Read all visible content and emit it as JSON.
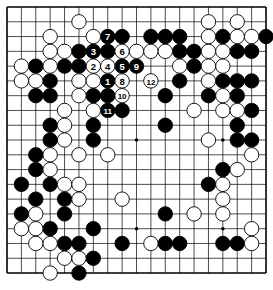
{
  "board": {
    "size": 19,
    "origin": {
      "x": 7,
      "y": 7
    },
    "spacing": {
      "x": 14.39,
      "y": 14.78
    },
    "stone_radius": 7.2,
    "colors": {
      "background": "#ffffff",
      "line": "#000000",
      "black_stone": "#000000",
      "white_stone": "#ffffff",
      "stone_outline": "#000000",
      "label_on_black": "#ffffff",
      "label_on_white": "#000000"
    },
    "star_points": [
      [
        3,
        3
      ],
      [
        9,
        3
      ],
      [
        15,
        3
      ],
      [
        3,
        9
      ],
      [
        9,
        9
      ],
      [
        15,
        9
      ],
      [
        3,
        15
      ],
      [
        9,
        15
      ],
      [
        15,
        15
      ]
    ]
  },
  "stones": {
    "black": [
      [
        7,
        2,
        "7"
      ],
      [
        8,
        2
      ],
      [
        10,
        2
      ],
      [
        11,
        2
      ],
      [
        12,
        2
      ],
      [
        15,
        2
      ],
      [
        18,
        2
      ],
      [
        5,
        3
      ],
      [
        6,
        3,
        "3"
      ],
      [
        7,
        3
      ],
      [
        12,
        3
      ],
      [
        13,
        3
      ],
      [
        16,
        3
      ],
      [
        17,
        3
      ],
      [
        2,
        4
      ],
      [
        4,
        4
      ],
      [
        5,
        4
      ],
      [
        8,
        4,
        "5"
      ],
      [
        9,
        4,
        "9"
      ],
      [
        13,
        4
      ],
      [
        3,
        5
      ],
      [
        7,
        5,
        "1"
      ],
      [
        12,
        5
      ],
      [
        15,
        5
      ],
      [
        16,
        5
      ],
      [
        17,
        5
      ],
      [
        2,
        6
      ],
      [
        3,
        6
      ],
      [
        6,
        6
      ],
      [
        7,
        6
      ],
      [
        11,
        6
      ],
      [
        14,
        6
      ],
      [
        16,
        6
      ],
      [
        7,
        7,
        "11"
      ],
      [
        8,
        7
      ],
      [
        17,
        7
      ],
      [
        3,
        8
      ],
      [
        6,
        8
      ],
      [
        11,
        8
      ],
      [
        16,
        8
      ],
      [
        3,
        9
      ],
      [
        6,
        9
      ],
      [
        16,
        9
      ],
      [
        17,
        9
      ],
      [
        2,
        10
      ],
      [
        2,
        11
      ],
      [
        15,
        11
      ],
      [
        1,
        12
      ],
      [
        3,
        12
      ],
      [
        14,
        12
      ],
      [
        2,
        13
      ],
      [
        4,
        13
      ],
      [
        1,
        14
      ],
      [
        4,
        14
      ],
      [
        11,
        14
      ],
      [
        3,
        15
      ],
      [
        6,
        15
      ],
      [
        4,
        16
      ],
      [
        5,
        16
      ],
      [
        8,
        16
      ],
      [
        11,
        16
      ],
      [
        12,
        16
      ],
      [
        15,
        16
      ],
      [
        16,
        16
      ],
      [
        6,
        17
      ],
      [
        5,
        18
      ]
    ],
    "white": [
      [
        5,
        1
      ],
      [
        14,
        1
      ],
      [
        16,
        1
      ],
      [
        3,
        2
      ],
      [
        6,
        2
      ],
      [
        14,
        2
      ],
      [
        16,
        2
      ],
      [
        17,
        2
      ],
      [
        3,
        3
      ],
      [
        4,
        3
      ],
      [
        8,
        3,
        "6"
      ],
      [
        9,
        3
      ],
      [
        10,
        3
      ],
      [
        11,
        3
      ],
      [
        14,
        3
      ],
      [
        15,
        3
      ],
      [
        1,
        4
      ],
      [
        3,
        4
      ],
      [
        6,
        4,
        "2"
      ],
      [
        7,
        4,
        "4"
      ],
      [
        12,
        4
      ],
      [
        14,
        4
      ],
      [
        15,
        4
      ],
      [
        1,
        5
      ],
      [
        2,
        5
      ],
      [
        5,
        5
      ],
      [
        6,
        5
      ],
      [
        8,
        5,
        "8"
      ],
      [
        10,
        5,
        "12"
      ],
      [
        14,
        5
      ],
      [
        5,
        6
      ],
      [
        8,
        6,
        "10"
      ],
      [
        15,
        6
      ],
      [
        4,
        7
      ],
      [
        6,
        7
      ],
      [
        13,
        7
      ],
      [
        15,
        7
      ],
      [
        16,
        7
      ],
      [
        4,
        8
      ],
      [
        4,
        9
      ],
      [
        14,
        9
      ],
      [
        3,
        10
      ],
      [
        5,
        10
      ],
      [
        7,
        10
      ],
      [
        17,
        10
      ],
      [
        3,
        11
      ],
      [
        16,
        11
      ],
      [
        4,
        12
      ],
      [
        5,
        12
      ],
      [
        15,
        12
      ],
      [
        5,
        13
      ],
      [
        8,
        13
      ],
      [
        15,
        13
      ],
      [
        2,
        14
      ],
      [
        13,
        14
      ],
      [
        15,
        14
      ],
      [
        1,
        15
      ],
      [
        2,
        15
      ],
      [
        17,
        15
      ],
      [
        2,
        16
      ],
      [
        3,
        16
      ],
      [
        10,
        16
      ],
      [
        17,
        16
      ],
      [
        4,
        17
      ],
      [
        5,
        17
      ],
      [
        3,
        18
      ]
    ]
  },
  "move_labels": [
    "1",
    "2",
    "3",
    "4",
    "5",
    "6",
    "7",
    "8",
    "9",
    "10",
    "11",
    "12"
  ]
}
